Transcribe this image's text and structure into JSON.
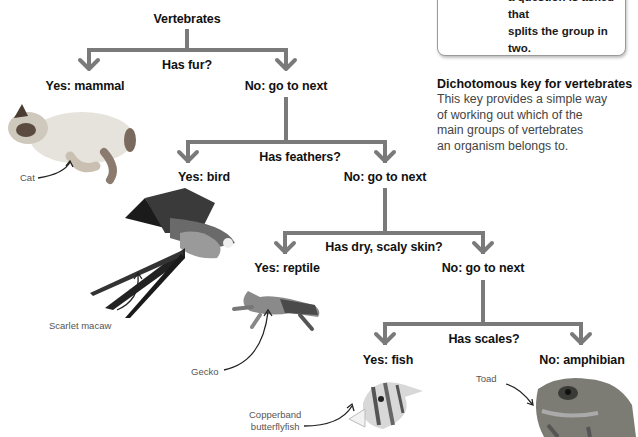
{
  "info_box": {
    "lines": [
      "a question is asked that",
      "splits the group in two."
    ]
  },
  "description": {
    "title": "Dichotomous key for vertebrates",
    "body_lines": [
      "This key provides a simple way",
      "of working out which of the",
      "main groups of vertebrates",
      "an organism belongs to."
    ]
  },
  "key": {
    "root": "Vertebrates",
    "levels": [
      {
        "question": "Has fur?",
        "yes": "Yes: mammal",
        "no": "No: go to next"
      },
      {
        "question": "Has feathers?",
        "yes": "Yes: bird",
        "no": "No: go to next"
      },
      {
        "question": "Has dry, scaly skin?",
        "yes": "Yes: reptile",
        "no": "No: go to next"
      },
      {
        "question": "Has scales?",
        "yes": "Yes: fish",
        "no": "No: amphibian"
      }
    ],
    "line_color": "#7a7a7a"
  },
  "animals": {
    "cat": "Cat",
    "macaw": "Scarlet macaw",
    "gecko": "Gecko",
    "fish_line1": "Copperband",
    "fish_line2": "butterflyfish",
    "toad": "Toad"
  }
}
